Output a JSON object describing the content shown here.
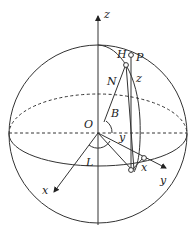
{
  "diagram": {
    "colors": {
      "line": "#333333",
      "background": "#ffffff",
      "text": "#222222"
    },
    "labels": {
      "z_axis": "z",
      "x_axis": "x",
      "y_axis": "y",
      "origin": "O",
      "H": "H",
      "P": "P",
      "N": "N",
      "z_segment": "z",
      "B": "B",
      "L": "L",
      "y_segment": "y",
      "x_segment": "x"
    },
    "geometry": {
      "sphere_center": [
        98,
        134
      ],
      "sphere_radius": 89,
      "equator_ry": 32,
      "origin": [
        98,
        133
      ],
      "point_P": [
        131,
        54
      ],
      "point_H": [
        126,
        63
      ],
      "point_ground": [
        132,
        170
      ],
      "point_x_on_y": [
        143,
        158
      ],
      "x_axis_end": [
        52,
        195
      ],
      "y_axis_end": [
        168,
        169
      ]
    }
  }
}
